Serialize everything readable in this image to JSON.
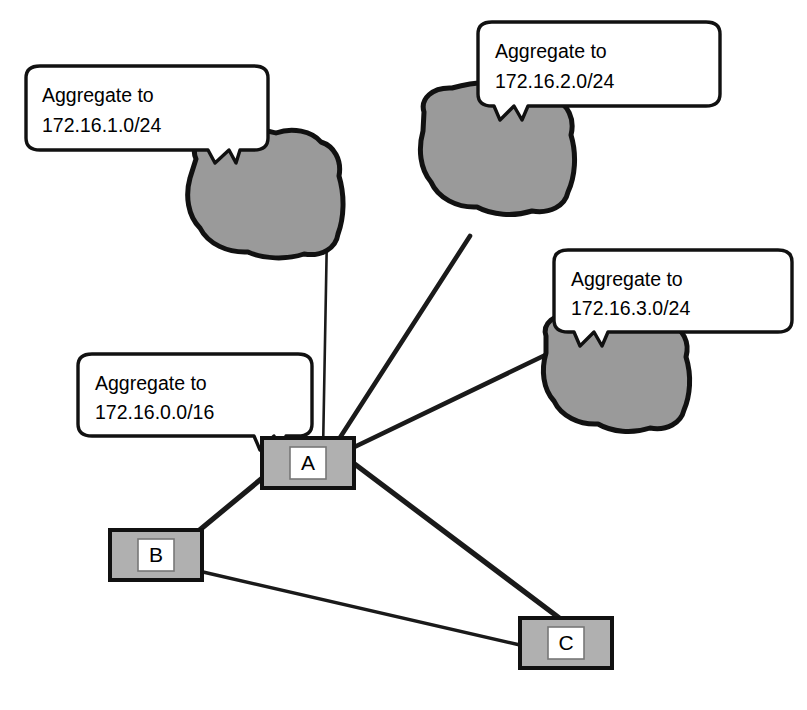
{
  "diagram": {
    "background_color": "#ffffff",
    "line_color": "#1a1a1a",
    "cloud_fill": "#9a9a9a",
    "cloud_stroke": "#111111",
    "node_fill": "#b0b0b0",
    "node_stroke": "#111111",
    "node_inner_fill": "#ffffff",
    "callout_fill": "#ffffff",
    "callout_stroke": "#111111"
  },
  "callouts": [
    {
      "id": "callout-1",
      "line1": "Aggregate to",
      "line2": "172.16.1.0/24",
      "target": "cloud-1"
    },
    {
      "id": "callout-2",
      "line1": "Aggregate to",
      "line2": "172.16.2.0/24",
      "target": "cloud-2"
    },
    {
      "id": "callout-3",
      "line1": "Aggregate to",
      "line2": "172.16.3.0/24",
      "target": "cloud-3"
    },
    {
      "id": "callout-4",
      "line1": "Aggregate to",
      "line2": "172.16.0.0/16",
      "target": "router-a"
    }
  ],
  "clouds": [
    {
      "id": "cloud-1",
      "name": "network-cloud-1"
    },
    {
      "id": "cloud-2",
      "name": "network-cloud-2"
    },
    {
      "id": "cloud-3",
      "name": "network-cloud-3"
    }
  ],
  "routers": [
    {
      "id": "router-a",
      "label": "A"
    },
    {
      "id": "router-b",
      "label": "B"
    },
    {
      "id": "router-c",
      "label": "C"
    }
  ],
  "links": [
    {
      "from": "router-a",
      "to": "cloud-1",
      "weight": "thin"
    },
    {
      "from": "router-a",
      "to": "cloud-2",
      "weight": "thick"
    },
    {
      "from": "router-a",
      "to": "cloud-3",
      "weight": "thick"
    },
    {
      "from": "router-a",
      "to": "router-b",
      "weight": "thick"
    },
    {
      "from": "router-a",
      "to": "router-c",
      "weight": "thick"
    },
    {
      "from": "router-b",
      "to": "router-c",
      "weight": "medium"
    }
  ]
}
